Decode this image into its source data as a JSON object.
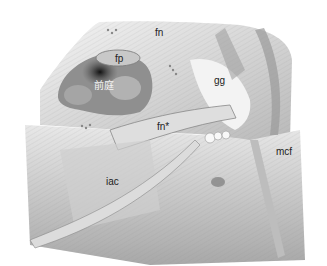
{
  "figure": {
    "type": "anatomical-illustration",
    "labels": {
      "fn_top": "fn",
      "fp": "fp",
      "vestibule": "前庭",
      "gg": "gg",
      "fn_star": "fn*",
      "iac": "iac",
      "mcf": "mcf"
    }
  }
}
